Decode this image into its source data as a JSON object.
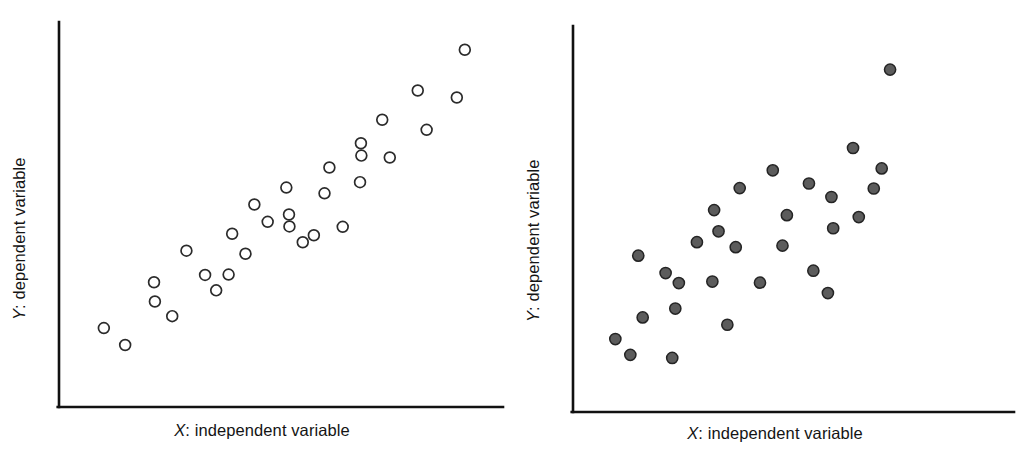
{
  "figure": {
    "background": "#ffffff",
    "axis_color": "#111111"
  },
  "panels": [
    {
      "id": "left",
      "marker_style": "open-circle",
      "marker_fill": "#ffffff",
      "marker_stroke": "#2b2b2b",
      "x_label_var": "X",
      "x_label_text": ": independent variable",
      "y_label_var": "Y",
      "y_label_text": ": dependent variable"
    },
    {
      "id": "right",
      "marker_style": "filled-circle",
      "marker_fill": "#5c5c5c",
      "marker_stroke": "#242424",
      "x_label_var": "X",
      "x_label_text": ": independent variable",
      "y_label_var": "Y",
      "y_label_text": ": dependent variable"
    }
  ],
  "chart_data": [
    {
      "type": "scatter",
      "panel": "left",
      "title": "",
      "xlabel": "X: independent variable",
      "ylabel": "Y: dependent variable",
      "xlim": [
        0,
        100
      ],
      "ylim": [
        0,
        100
      ],
      "grid": false,
      "legend": "none",
      "annotation": "strong positive linear relationship",
      "marker": "open circle",
      "n_points": 30,
      "points": [
        {
          "x": 10.1,
          "y": 20.5
        },
        {
          "x": 14.9,
          "y": 16.1
        },
        {
          "x": 21.4,
          "y": 32.4
        },
        {
          "x": 21.6,
          "y": 27.4
        },
        {
          "x": 25.5,
          "y": 23.6
        },
        {
          "x": 28.7,
          "y": 40.6
        },
        {
          "x": 32.9,
          "y": 34.3
        },
        {
          "x": 35.4,
          "y": 30.3
        },
        {
          "x": 38.2,
          "y": 34.4
        },
        {
          "x": 39.0,
          "y": 45.0
        },
        {
          "x": 42.0,
          "y": 39.8
        },
        {
          "x": 44.0,
          "y": 52.6
        },
        {
          "x": 47.0,
          "y": 48.1
        },
        {
          "x": 51.2,
          "y": 57.0
        },
        {
          "x": 51.8,
          "y": 50.0
        },
        {
          "x": 51.9,
          "y": 46.9
        },
        {
          "x": 54.9,
          "y": 42.8
        },
        {
          "x": 57.4,
          "y": 44.6
        },
        {
          "x": 59.8,
          "y": 55.5
        },
        {
          "x": 60.9,
          "y": 62.2
        },
        {
          "x": 63.9,
          "y": 46.8
        },
        {
          "x": 67.8,
          "y": 58.4
        },
        {
          "x": 68.0,
          "y": 68.5
        },
        {
          "x": 68.1,
          "y": 65.3
        },
        {
          "x": 72.8,
          "y": 74.6
        },
        {
          "x": 74.5,
          "y": 64.8
        },
        {
          "x": 82.8,
          "y": 72.0
        },
        {
          "x": 80.8,
          "y": 82.2
        },
        {
          "x": 89.6,
          "y": 80.4
        },
        {
          "x": 91.4,
          "y": 92.8
        }
      ]
    },
    {
      "type": "scatter",
      "panel": "right",
      "title": "",
      "xlabel": "X: independent variable",
      "ylabel": "Y: dependent variable",
      "xlim": [
        0,
        100
      ],
      "ylim": [
        0,
        100
      ],
      "grid": false,
      "legend": "none",
      "annotation": "weak to moderate positive relationship",
      "marker": "filled circle",
      "n_points": 30,
      "points": [
        {
          "x": 9.6,
          "y": 18.9
        },
        {
          "x": 13.0,
          "y": 14.8
        },
        {
          "x": 15.8,
          "y": 24.5
        },
        {
          "x": 14.8,
          "y": 40.5
        },
        {
          "x": 21.0,
          "y": 36.0
        },
        {
          "x": 24.0,
          "y": 33.4
        },
        {
          "x": 23.2,
          "y": 26.8
        },
        {
          "x": 22.5,
          "y": 14.0
        },
        {
          "x": 28.1,
          "y": 44.0
        },
        {
          "x": 32.0,
          "y": 52.3
        },
        {
          "x": 33.0,
          "y": 46.8
        },
        {
          "x": 31.6,
          "y": 33.8
        },
        {
          "x": 35.0,
          "y": 22.6
        },
        {
          "x": 37.8,
          "y": 58.0
        },
        {
          "x": 36.9,
          "y": 42.7
        },
        {
          "x": 45.3,
          "y": 62.6
        },
        {
          "x": 42.4,
          "y": 33.5
        },
        {
          "x": 48.5,
          "y": 51.0
        },
        {
          "x": 47.5,
          "y": 43.1
        },
        {
          "x": 53.5,
          "y": 59.2
        },
        {
          "x": 54.5,
          "y": 36.6
        },
        {
          "x": 58.6,
          "y": 55.7
        },
        {
          "x": 59.0,
          "y": 47.6
        },
        {
          "x": 57.8,
          "y": 30.8
        },
        {
          "x": 63.5,
          "y": 68.4
        },
        {
          "x": 64.8,
          "y": 50.5
        },
        {
          "x": 68.2,
          "y": 57.9
        },
        {
          "x": 70.0,
          "y": 63.1
        },
        {
          "x": 71.9,
          "y": 88.7
        }
      ]
    }
  ]
}
